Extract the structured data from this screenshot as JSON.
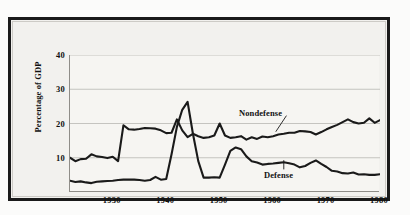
{
  "figure": {
    "y_axis_title": "Percentage of GDP",
    "frame_color": "#1a1a1a",
    "plot_background": "#f6f5f2",
    "line_color": "#1a1a1a"
  },
  "chart_data": {
    "type": "line",
    "title": "",
    "xlabel": "",
    "ylabel": "Percentage of GDP",
    "xlim": [
      1922,
      1980
    ],
    "ylim": [
      0,
      40
    ],
    "xticks": [
      1930,
      1940,
      1950,
      1960,
      1970,
      1980
    ],
    "yticks": [
      10,
      20,
      30,
      40
    ],
    "grid": "horizontal",
    "legend_position": "inline-annotations",
    "annotations": [
      {
        "text": "Nondefense",
        "series": "Nondefense",
        "x": 1962,
        "y": 23.5
      },
      {
        "text": "Defense",
        "series": "Defense",
        "x": 1962,
        "y": 5.5
      }
    ],
    "x": [
      1922,
      1923,
      1924,
      1925,
      1926,
      1927,
      1928,
      1929,
      1930,
      1931,
      1932,
      1933,
      1934,
      1935,
      1936,
      1937,
      1938,
      1939,
      1940,
      1941,
      1942,
      1943,
      1944,
      1945,
      1946,
      1947,
      1948,
      1949,
      1950,
      1951,
      1952,
      1953,
      1954,
      1955,
      1956,
      1957,
      1958,
      1959,
      1960,
      1961,
      1962,
      1963,
      1964,
      1965,
      1966,
      1967,
      1968,
      1969,
      1970,
      1971,
      1972,
      1973,
      1974,
      1975,
      1976,
      1977,
      1978,
      1979,
      1980
    ],
    "series": [
      {
        "name": "Nondefense",
        "values": [
          10.0,
          9.0,
          9.6,
          9.7,
          11.0,
          10.4,
          10.2,
          9.9,
          10.3,
          9.0,
          19.5,
          18.3,
          18.2,
          18.4,
          18.7,
          18.6,
          18.5,
          18.0,
          17.2,
          17.3,
          21.2,
          18.0,
          16.0,
          17.0,
          16.3,
          15.8,
          16.0,
          16.5,
          20.0,
          16.5,
          15.8,
          16.0,
          16.3,
          15.3,
          16.0,
          15.5,
          16.2,
          16.0,
          16.3,
          16.8,
          17.0,
          17.3,
          17.3,
          17.8,
          17.7,
          17.5,
          16.8,
          17.5,
          18.3,
          19.0,
          19.6,
          20.4,
          21.2,
          20.4,
          20.0,
          20.2,
          21.5,
          20.2,
          21.0
        ]
      },
      {
        "name": "Defense",
        "values": [
          3.3,
          2.9,
          3.1,
          2.8,
          2.6,
          3.0,
          3.1,
          3.2,
          3.3,
          3.5,
          3.6,
          3.6,
          3.6,
          3.5,
          3.3,
          3.5,
          4.4,
          3.6,
          3.8,
          11.0,
          19.0,
          24.0,
          26.3,
          17.0,
          9.0,
          4.2,
          4.2,
          4.3,
          4.2,
          8.0,
          12.0,
          13.0,
          12.5,
          10.4,
          9.0,
          8.6,
          8.0,
          8.2,
          8.3,
          8.5,
          8.7,
          8.4,
          8.0,
          7.2,
          7.6,
          8.5,
          9.2,
          8.2,
          7.3,
          6.2,
          6.0,
          5.5,
          5.4,
          5.7,
          5.1,
          5.2,
          5.0,
          5.0,
          5.2
        ]
      }
    ]
  }
}
